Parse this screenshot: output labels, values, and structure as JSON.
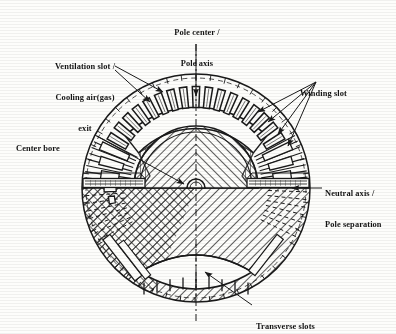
{
  "figure": {
    "kind": "engineering-cross-section",
    "stroke_color": "#1a1a1a",
    "background_color": "#fdfdfb"
  },
  "labels": {
    "pole_center": {
      "line1": "Pole center /",
      "line2": "Pole axis"
    },
    "ventilation": {
      "line1": "Ventilation slot /",
      "line2": "Cooling air(gas)",
      "line3": "exit"
    },
    "winding_slot": {
      "line1": "Winding slot"
    },
    "center_bore": {
      "line1": "Center bore"
    },
    "neutral_axis": {
      "line1": "Neutral axis /",
      "line2": "Pole separation"
    },
    "transverse_slots": {
      "line1": "Transverse slots"
    }
  },
  "geometry": {
    "center_x": 196,
    "center_y": 188,
    "outer_radius": 114,
    "pole_body_radius": 62,
    "bore_radius": 9,
    "winding_slot_count": 17,
    "pole_arc_start_deg": 226,
    "pole_arc_end_deg": 314
  }
}
